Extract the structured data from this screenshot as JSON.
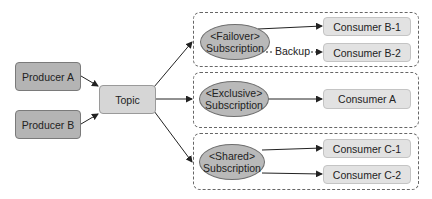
{
  "producers": [
    {
      "label": "Producer A"
    },
    {
      "label": "Producer B"
    }
  ],
  "topic": {
    "label": "Topic"
  },
  "subscriptions": [
    {
      "type": "<Failover>",
      "label": "Subscription",
      "consumers": [
        {
          "label": "Consumer B-1"
        },
        {
          "label": "Consumer B-2"
        }
      ],
      "edge_label": "Backup"
    },
    {
      "type": "<Exclusive>",
      "label": "Subscription",
      "consumers": [
        {
          "label": "Consumer A"
        }
      ]
    },
    {
      "type": "<Shared>",
      "label": "Subscription",
      "consumers": [
        {
          "label": "Consumer C-1"
        },
        {
          "label": "Consumer C-2"
        }
      ]
    }
  ],
  "colors": {
    "producer_fill": "#b4b4b4",
    "topic_fill": "#d6d6d6",
    "subscription_fill": "#b9b9b9",
    "consumer_fill": "#e2e2e2",
    "line": "#333333"
  }
}
